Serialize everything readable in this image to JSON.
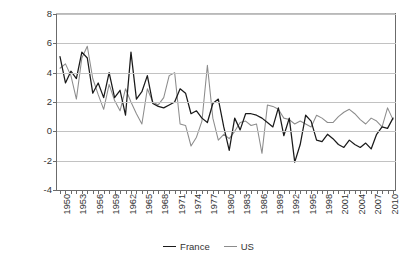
{
  "chart_data": {
    "type": "line",
    "title": "",
    "xlabel": "",
    "ylabel": "Percentage",
    "ylim": [
      -4,
      8
    ],
    "ytick_values": [
      -4,
      -2,
      0,
      2,
      4,
      6,
      8
    ],
    "ytick_labels": [
      "-4",
      "-2",
      "0",
      "2",
      "4",
      "6",
      "8"
    ],
    "xlim": [
      1950,
      2011
    ],
    "xtick_labels": [
      "1950",
      "1953",
      "1956",
      "1959",
      "1962",
      "1965",
      "1968",
      "1971",
      "1974",
      "1977",
      "1980",
      "1983",
      "1986",
      "1989",
      "1992",
      "1995",
      "1998",
      "2001",
      "2004",
      "2007",
      "2010"
    ],
    "xtick_step": 3,
    "grid": "horizontal",
    "legend_position": "bottom-center",
    "x": [
      1950,
      1951,
      1952,
      1953,
      1954,
      1955,
      1956,
      1957,
      1958,
      1959,
      1960,
      1961,
      1962,
      1963,
      1964,
      1965,
      1966,
      1967,
      1968,
      1969,
      1970,
      1971,
      1972,
      1973,
      1974,
      1975,
      1976,
      1977,
      1978,
      1979,
      1980,
      1981,
      1982,
      1983,
      1984,
      1985,
      1986,
      1987,
      1988,
      1989,
      1990,
      1991,
      1992,
      1993,
      1994,
      1995,
      1996,
      1997,
      1998,
      1999,
      2000,
      2001,
      2002,
      2003,
      2004,
      2005,
      2006,
      2007,
      2008,
      2009,
      2010,
      2011
    ],
    "series": [
      {
        "name": "France",
        "color": "#1a1a1a",
        "values": [
          5.1,
          3.3,
          4.1,
          3.6,
          5.4,
          5.0,
          2.6,
          3.3,
          2.3,
          4.0,
          2.3,
          2.8,
          1.1,
          5.4,
          2.2,
          2.7,
          3.8,
          1.9,
          1.7,
          1.6,
          1.8,
          2.0,
          2.9,
          2.6,
          1.2,
          1.4,
          0.9,
          0.6,
          1.9,
          2.2,
          0.3,
          -1.3,
          0.9,
          0.1,
          1.2,
          1.2,
          1.1,
          0.9,
          0.6,
          0.3,
          1.6,
          -0.3,
          0.9,
          -2.1,
          -0.9,
          1.1,
          0.7,
          -0.6,
          -0.7,
          -0.2,
          -0.5,
          -0.9,
          -1.1,
          -0.6,
          -0.9,
          -1.1,
          -0.8,
          -1.2,
          -0.2,
          0.3,
          0.2,
          0.9
        ]
      },
      {
        "name": "US",
        "color": "#8c8c8c",
        "values": [
          4.3,
          4.6,
          3.8,
          2.2,
          5.0,
          5.8,
          3.6,
          2.5,
          1.5,
          3.2,
          2.1,
          1.4,
          2.9,
          2.0,
          1.2,
          0.5,
          2.9,
          2.0,
          1.8,
          2.3,
          3.8,
          4.0,
          0.5,
          0.4,
          -1.0,
          -0.4,
          0.7,
          4.5,
          0.9,
          -0.6,
          -0.2,
          -0.5,
          0.0,
          0.6,
          0.7,
          0.4,
          0.5,
          -1.5,
          1.8,
          1.7,
          1.5,
          0.9,
          0.8,
          0.5,
          0.7,
          0.5,
          0.3,
          1.1,
          0.9,
          0.6,
          0.6,
          1.0,
          1.3,
          1.5,
          1.2,
          0.8,
          0.5,
          0.9,
          0.7,
          0.3,
          1.6,
          0.8
        ]
      }
    ]
  },
  "legend": {
    "entries": [
      {
        "label": "France",
        "color": "#1a1a1a"
      },
      {
        "label": "US",
        "color": "#8c8c8c"
      }
    ]
  }
}
